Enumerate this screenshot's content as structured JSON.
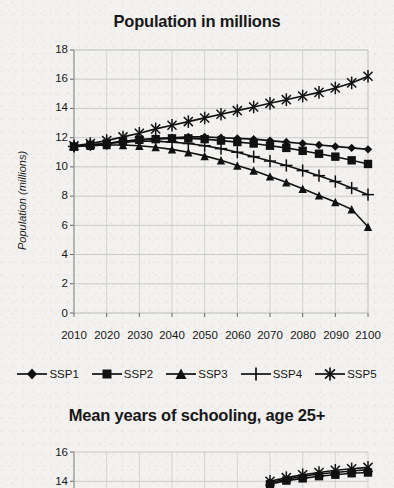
{
  "figures": [
    {
      "id": "population",
      "title": "Population in millions",
      "ylabel": "Population (millions)"
    },
    {
      "id": "schooling",
      "title": "Mean years of schooling, age 25+",
      "ylabel": ""
    }
  ],
  "legend": {
    "items": [
      {
        "label": "SSP1",
        "marker": "diamond-marker-icon"
      },
      {
        "label": "SSP2",
        "marker": "square-marker-icon"
      },
      {
        "label": "SSP3",
        "marker": "triangle-marker-icon"
      },
      {
        "label": "SSP4",
        "marker": "plus-marker-icon"
      },
      {
        "label": "SSP5",
        "marker": "asterisk-marker-icon"
      }
    ]
  },
  "chart_data": [
    {
      "type": "line",
      "title": "Population in millions",
      "xlabel": "",
      "ylabel": "Population (millions)",
      "xlim": [
        2010,
        2100
      ],
      "ylim": [
        0.0,
        18.0
      ],
      "ytick_step": 2.0,
      "grid": true,
      "legend_position": "bottom",
      "x": [
        2010,
        2015,
        2020,
        2025,
        2030,
        2035,
        2040,
        2045,
        2050,
        2055,
        2060,
        2065,
        2070,
        2075,
        2080,
        2085,
        2090,
        2095,
        2100
      ],
      "xticks": [
        2010,
        2020,
        2030,
        2040,
        2050,
        2060,
        2070,
        2080,
        2090,
        2100
      ],
      "yticks": [
        0.0,
        2.0,
        4.0,
        6.0,
        8.0,
        10.0,
        12.0,
        14.0,
        16.0,
        18.0
      ],
      "series": [
        {
          "name": "SSP1",
          "marker": "diamond",
          "values": [
            11.4,
            11.5,
            11.6,
            11.75,
            11.85,
            11.95,
            12.0,
            12.05,
            12.05,
            12.0,
            11.95,
            11.9,
            11.8,
            11.7,
            11.6,
            11.5,
            11.4,
            11.3,
            11.2
          ]
        },
        {
          "name": "SSP2",
          "marker": "square",
          "values": [
            11.4,
            11.5,
            11.6,
            11.75,
            11.85,
            11.9,
            11.95,
            11.95,
            11.9,
            11.8,
            11.7,
            11.6,
            11.45,
            11.3,
            11.1,
            10.9,
            10.7,
            10.45,
            10.2
          ]
        },
        {
          "name": "SSP3",
          "marker": "triangle",
          "values": [
            11.4,
            11.45,
            11.5,
            11.5,
            11.45,
            11.35,
            11.2,
            11.0,
            10.75,
            10.45,
            10.1,
            9.75,
            9.35,
            8.95,
            8.5,
            8.05,
            7.6,
            7.1,
            5.9
          ]
        },
        {
          "name": "SSP4",
          "marker": "plus",
          "values": [
            11.4,
            11.5,
            11.6,
            11.7,
            11.75,
            11.75,
            11.7,
            11.6,
            11.45,
            11.25,
            11.0,
            10.7,
            10.4,
            10.1,
            9.75,
            9.4,
            9.0,
            8.55,
            8.1
          ]
        },
        {
          "name": "SSP5",
          "marker": "asterisk",
          "values": [
            11.45,
            11.6,
            11.8,
            12.05,
            12.3,
            12.6,
            12.85,
            13.1,
            13.35,
            13.6,
            13.85,
            14.1,
            14.35,
            14.6,
            14.85,
            15.1,
            15.4,
            15.75,
            16.2
          ]
        }
      ]
    },
    {
      "type": "line",
      "title": "Mean years of schooling, age 25+",
      "xlabel": "",
      "ylabel": "",
      "ylim": [
        14.0,
        16.0
      ],
      "yticks": [
        14.0,
        16.0
      ],
      "grid": true,
      "cropped": true,
      "note": "Chart is cut off at the bottom edge of the screenshot; only the top portion is visible.",
      "series": [
        {
          "name": "SSP5",
          "marker": "asterisk",
          "values": [
            14.0,
            14.25,
            14.45,
            14.6,
            14.75,
            14.85,
            14.95
          ]
        },
        {
          "name": "SSP1",
          "marker": "diamond",
          "values": [
            13.9,
            14.15,
            14.35,
            14.5,
            14.6,
            14.7,
            14.8
          ]
        },
        {
          "name": "SSP2",
          "marker": "square",
          "values": [
            13.8,
            14.05,
            14.2,
            14.35,
            14.45,
            14.55,
            14.6
          ]
        }
      ]
    }
  ]
}
